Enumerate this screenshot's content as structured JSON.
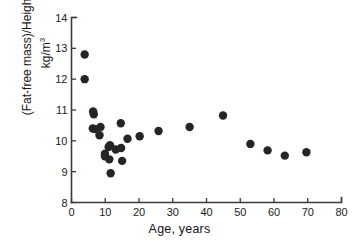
{
  "chart_data": {
    "type": "scatter",
    "title": "",
    "xlabel": "Age, years",
    "ylabel_line1": "(Fat-free mass)/Height",
    "ylabel_line1_sup": "3",
    "ylabel_line2": "kg/m",
    "ylabel_line2_sup": "3",
    "xlim": [
      0,
      80
    ],
    "ylim": [
      8,
      14
    ],
    "xticks": [
      0,
      10,
      20,
      30,
      40,
      50,
      60,
      70,
      80
    ],
    "yticks": [
      8,
      9,
      10,
      11,
      12,
      13,
      14
    ],
    "xtick_labels": [
      "0",
      "10",
      "20",
      "30",
      "40",
      "50",
      "60",
      "70",
      "80"
    ],
    "ytick_labels": [
      "8",
      "9",
      "10",
      "11",
      "12",
      "13",
      "14"
    ],
    "grid": false,
    "legend": false,
    "marker": "filled-circle",
    "marker_color": "#252525",
    "marker_size_px": 4.2,
    "axis_color": "#3b3b3b",
    "background_color": "#ffffff",
    "series": [
      {
        "name": "subjects",
        "points": [
          {
            "x": 3.9,
            "y": 12.8
          },
          {
            "x": 3.9,
            "y": 12.0
          },
          {
            "x": 6.4,
            "y": 10.95
          },
          {
            "x": 6.6,
            "y": 10.86
          },
          {
            "x": 6.3,
            "y": 10.4
          },
          {
            "x": 7.0,
            "y": 10.38
          },
          {
            "x": 8.6,
            "y": 10.45
          },
          {
            "x": 8.3,
            "y": 10.18
          },
          {
            "x": 9.9,
            "y": 9.58
          },
          {
            "x": 9.9,
            "y": 9.5
          },
          {
            "x": 11.0,
            "y": 9.8
          },
          {
            "x": 11.4,
            "y": 9.86
          },
          {
            "x": 11.2,
            "y": 9.4
          },
          {
            "x": 11.6,
            "y": 8.95
          },
          {
            "x": 13.1,
            "y": 9.72
          },
          {
            "x": 14.6,
            "y": 10.57
          },
          {
            "x": 14.7,
            "y": 9.77
          },
          {
            "x": 15.0,
            "y": 9.35
          },
          {
            "x": 16.6,
            "y": 10.07
          },
          {
            "x": 20.2,
            "y": 10.15
          },
          {
            "x": 25.8,
            "y": 10.32
          },
          {
            "x": 35.0,
            "y": 10.45
          },
          {
            "x": 44.9,
            "y": 10.82
          },
          {
            "x": 53.0,
            "y": 9.9
          },
          {
            "x": 58.1,
            "y": 9.69
          },
          {
            "x": 63.2,
            "y": 9.52
          },
          {
            "x": 69.6,
            "y": 9.63
          }
        ]
      }
    ]
  }
}
